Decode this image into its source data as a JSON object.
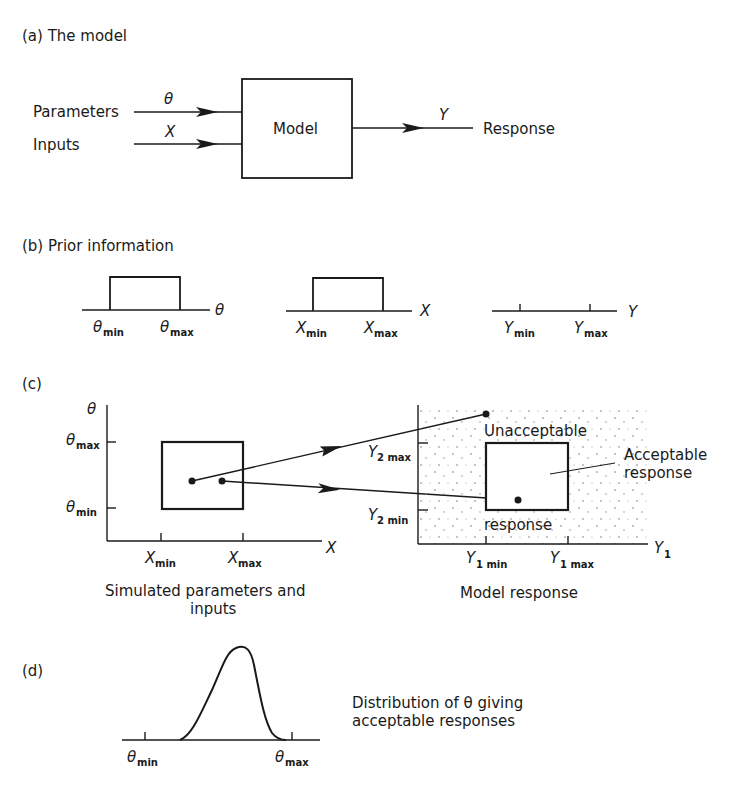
{
  "panel_a": {
    "label": "(a) The model",
    "parameters_label": "Parameters",
    "inputs_label": "Inputs",
    "theta_symbol": "θ",
    "x_symbol": "X",
    "model_label": "Model",
    "y_symbol": "Y",
    "response_label": "Response"
  },
  "panel_b": {
    "label": "(b) Prior information",
    "theta_axis": "θ",
    "theta_min": "θ",
    "theta_min_sub": "min",
    "theta_max": "θ",
    "theta_max_sub": "max",
    "x_axis": "X",
    "x_min": "X",
    "x_min_sub": "min",
    "x_max": "X",
    "x_max_sub": "max",
    "y_axis": "Y",
    "y_min": "Y",
    "y_min_sub": "min",
    "y_max": "Y",
    "y_max_sub": "max"
  },
  "panel_c": {
    "label": "(c)",
    "left": {
      "y_axis": "θ",
      "theta_max": "θ",
      "theta_max_sub": "max",
      "theta_min": "θ",
      "theta_min_sub": "min",
      "x_axis": "X",
      "x_min": "X",
      "x_min_sub": "min",
      "x_max": "X",
      "x_max_sub": "max",
      "caption_line1": "Simulated parameters and",
      "caption_line2": "inputs"
    },
    "right": {
      "y2_max": "Y",
      "y2_max_sub": "2 max",
      "y2_min": "Y",
      "y2_min_sub": "2 min",
      "x_axis": "Y",
      "x_axis_sub": "1",
      "y1_min": "Y",
      "y1_min_sub": "1 min",
      "y1_max": "Y",
      "y1_max_sub": "1 max",
      "unacceptable_label": "Unacceptable",
      "response_label": "response",
      "acceptable_line1": "Acceptable",
      "acceptable_line2": "response",
      "caption": "Model response"
    }
  },
  "panel_d": {
    "label": "(d)",
    "theta_min": "θ",
    "theta_min_sub": "min",
    "theta_max": "θ",
    "theta_max_sub": "max",
    "description_line1": "Distribution of θ giving",
    "description_line2": "acceptable responses"
  },
  "colors": {
    "ink": "#1a1a1a",
    "paper": "#ffffff"
  }
}
